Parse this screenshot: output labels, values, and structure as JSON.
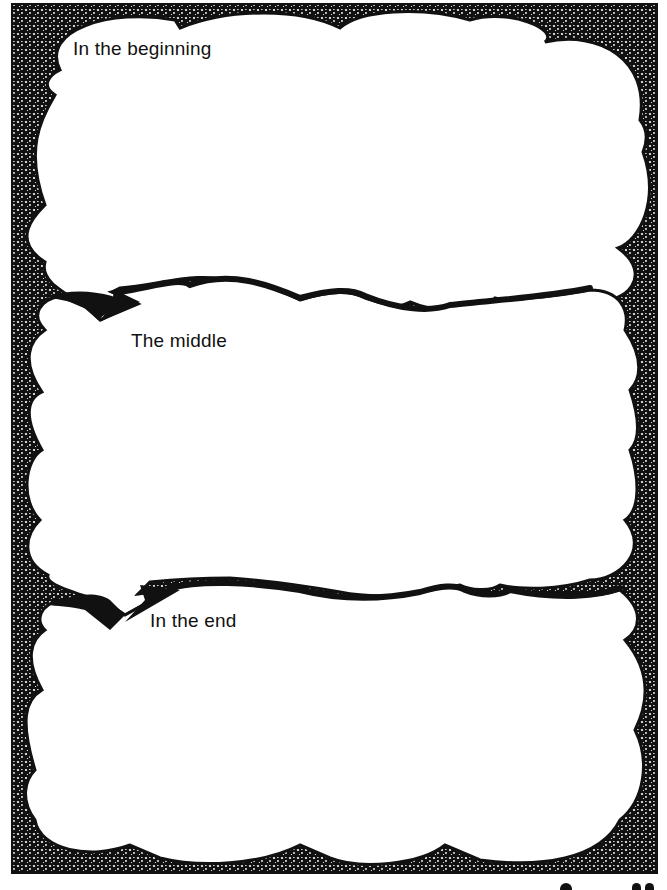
{
  "worksheet": {
    "sections": [
      {
        "id": "beginning",
        "label": "In the beginning"
      },
      {
        "id": "middle",
        "label": "The middle"
      },
      {
        "id": "end",
        "label": "In the end"
      }
    ]
  },
  "colors": {
    "ink": "#111111",
    "paper": "#ffffff"
  },
  "icons": {
    "speech-tail": "cloud-bubble-pointer",
    "stipple-border": "dotted-texture-frame"
  }
}
